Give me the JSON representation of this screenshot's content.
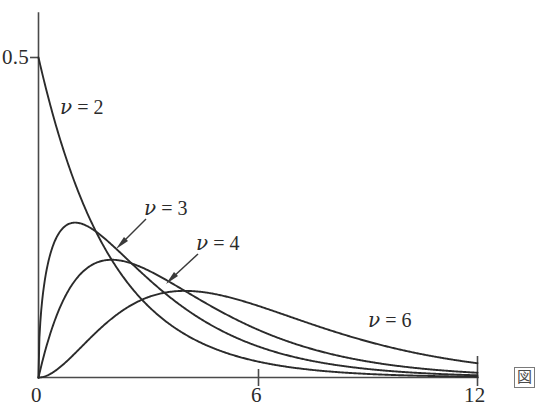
{
  "figure": {
    "background_color": "#ffffff",
    "line_color": "#2b2b2b",
    "axis_color": "#4a4a4a"
  },
  "axes": {
    "y_tick_label": "0.5",
    "x_tick_labels": [
      "0",
      "6",
      "12"
    ]
  },
  "labels": {
    "nu2": {
      "nu": "ν",
      "eq": " = ",
      "val": "2"
    },
    "nu3": {
      "nu": "ν",
      "eq": " = ",
      "val": "3"
    },
    "nu4": {
      "nu": "ν",
      "eq": " = ",
      "val": "4"
    },
    "nu6": {
      "nu": "ν",
      "eq": " = ",
      "val": "6"
    }
  },
  "corner": {
    "glyph": "図"
  },
  "chart_data": {
    "type": "line",
    "title": "",
    "xlabel": "",
    "ylabel": "",
    "xlim": [
      0,
      12
    ],
    "ylim": [
      0,
      0.53
    ],
    "xticks": [
      0,
      6,
      12
    ],
    "xticklabels": [
      "0",
      "6",
      "12"
    ],
    "yticks": [
      0.5
    ],
    "yticklabels": [
      "0.5"
    ],
    "grid": false,
    "legend": "inline-annotations",
    "x": [
      0,
      0.25,
      0.5,
      0.75,
      1,
      1.5,
      2,
      2.5,
      3,
      3.5,
      4,
      4.5,
      5,
      6,
      7,
      8,
      9,
      10,
      11,
      12
    ],
    "series": [
      {
        "name": "ν = 2",
        "nu": 2,
        "peak_x": 0,
        "peak_y": 0.5,
        "values": [
          0.5,
          0.4412,
          0.3894,
          0.3436,
          0.3033,
          0.2362,
          0.1839,
          0.1433,
          0.1116,
          0.0869,
          0.0677,
          0.0527,
          0.041,
          0.0249,
          0.0151,
          0.0092,
          0.0056,
          0.0034,
          0.002,
          0.0012
        ]
      },
      {
        "name": "ν = 3",
        "nu": 3,
        "peak_x": 1.0,
        "peak_y": 0.242,
        "values": [
          0,
          0.176,
          0.2197,
          0.2367,
          0.242,
          0.2332,
          0.2076,
          0.1796,
          0.1542,
          0.1318,
          0.112,
          0.0948,
          0.08,
          0.0564,
          0.0394,
          0.0272,
          0.0186,
          0.0127,
          0.0086,
          0.0058
        ]
      },
      {
        "name": "ν = 4",
        "nu": 4,
        "peak_x": 2.0,
        "peak_y": 0.1839,
        "values": [
          0,
          0.0552,
          0.0974,
          0.1288,
          0.1516,
          0.1772,
          0.1839,
          0.1791,
          0.1674,
          0.1521,
          0.1353,
          0.1186,
          0.1026,
          0.0747,
          0.0532,
          0.0366,
          0.025,
          0.0168,
          0.0113,
          0.0074
        ]
      },
      {
        "name": "ν = 6",
        "nu": 6,
        "peak_x": 4.0,
        "peak_y": 0.1353,
        "values": [
          0,
          0.0023,
          0.0081,
          0.0166,
          0.0264,
          0.047,
          0.0677,
          0.0855,
          0.0996,
          0.1095,
          0.1353,
          0.1187,
          0.1191,
          0.112,
          0.0971,
          0.0821,
          0.0667,
          0.0532,
          0.0418,
          0.0324
        ]
      }
    ]
  }
}
